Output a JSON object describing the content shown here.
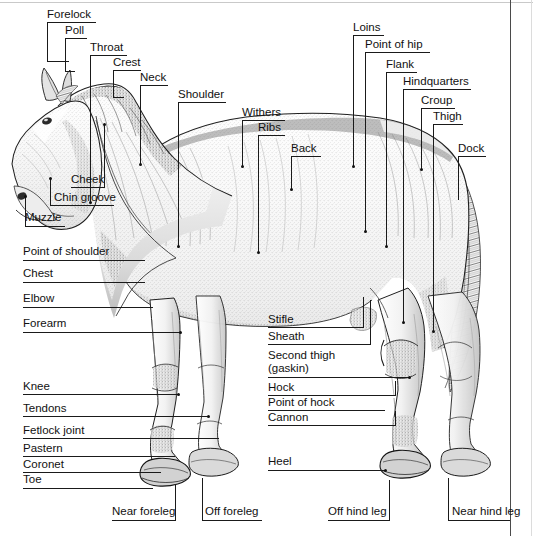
{
  "diagram": {
    "frame_color": "#4a4a4a",
    "line_color": "#1a1a1a",
    "text_color": "#111111",
    "background": "#ffffff"
  },
  "labels": {
    "forelock": "Forelock",
    "poll": "Poll",
    "throat": "Throat",
    "crest": "Crest",
    "neck": "Neck",
    "shoulder": "Shoulder",
    "withers": "Withers",
    "ribs": "Ribs",
    "back": "Back",
    "loins": "Loins",
    "point_of_hip": "Point of hip",
    "flank": "Flank",
    "hindquarters": "Hindquarters",
    "croup": "Croup",
    "thigh": "Thigh",
    "dock": "Dock",
    "cheek": "Cheek",
    "chin_groove": "Chin groove",
    "muzzle": "Muzzle",
    "point_of_shoulder": "Point of shoulder",
    "chest": "Chest",
    "elbow": "Elbow",
    "forearm": "Forearm",
    "knee": "Knee",
    "tendons": "Tendons",
    "fetlock_joint": "Fetlock joint",
    "pastern": "Pastern",
    "coronet": "Coronet",
    "toe": "Toe",
    "stifle": "Stifle",
    "sheath": "Sheath",
    "second_thigh_line1": "Second thigh",
    "second_thigh_line2": "(gaskin)",
    "hock": "Hock",
    "point_of_hock": "Point of hock",
    "cannon": "Cannon",
    "heel": "Heel",
    "near_foreleg": "Near foreleg",
    "off_foreleg": "Off foreleg",
    "off_hind_leg": "Off hind leg",
    "near_hind_leg": "Near hind leg"
  }
}
